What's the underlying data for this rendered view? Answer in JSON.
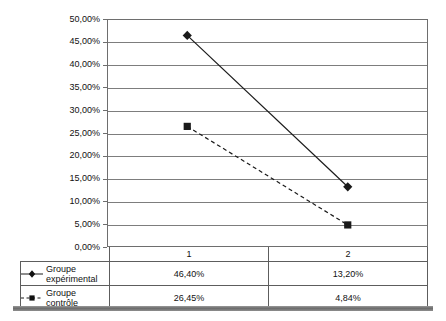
{
  "chart_data": {
    "type": "line",
    "title": "",
    "subtitle": "",
    "xlabel": "",
    "ylabel": "",
    "categories": [
      "1",
      "2"
    ],
    "ylim": [
      0,
      0.5
    ],
    "ytick_labels": [
      "50,00%",
      "45,00%",
      "40,00%",
      "35,00%",
      "30,00%",
      "25,00%",
      "20,00%",
      "15,00%",
      "10,00%",
      "5,00%",
      "0,00%"
    ],
    "ytick_values": [
      0.5,
      0.45,
      0.4,
      0.35,
      0.3,
      0.25,
      0.2,
      0.15,
      0.1,
      0.05,
      0.0
    ],
    "grid": true,
    "legend_position": "bottom-table",
    "series": [
      {
        "name": "Groupe expérimental",
        "name_line1": "Groupe",
        "name_line2": "expérimental",
        "values": [
          0.464,
          0.132
        ],
        "labels": [
          "46,40%",
          "13,20%"
        ],
        "line_style": "solid",
        "marker": "diamond",
        "color": "#1a1a1a"
      },
      {
        "name": "Groupe contrôle",
        "name_line1": "Groupe",
        "name_line2": "contrôle",
        "values": [
          0.2645,
          0.0484
        ],
        "labels": [
          "26,45%",
          "4,84%"
        ],
        "line_style": "dashed",
        "marker": "square",
        "color": "#1a1a1a"
      }
    ]
  },
  "table": {
    "corner_label": "",
    "column_headers": [
      "1",
      "2"
    ],
    "rows": [
      {
        "legend_line1": "Groupe",
        "legend_line2": "expérimental",
        "cells": [
          "46,40%",
          "13,20%"
        ]
      },
      {
        "legend_line1": "Groupe",
        "legend_line2": "contrôle",
        "cells": [
          "26,45%",
          "4,84%"
        ]
      }
    ]
  },
  "axis": {
    "y_labels": [
      "50,00%",
      "45,00%",
      "40,00%",
      "35,00%",
      "30,00%",
      "25,00%",
      "20,00%",
      "15,00%",
      "10,00%",
      "5,00%",
      "0,00%"
    ]
  },
  "colors": {
    "axis": "#6e6e6e",
    "grid": "#7d7d7d",
    "series": "#1a1a1a",
    "table_border": "#5d5d5d",
    "bottom_bar": "#6b6b6b"
  }
}
